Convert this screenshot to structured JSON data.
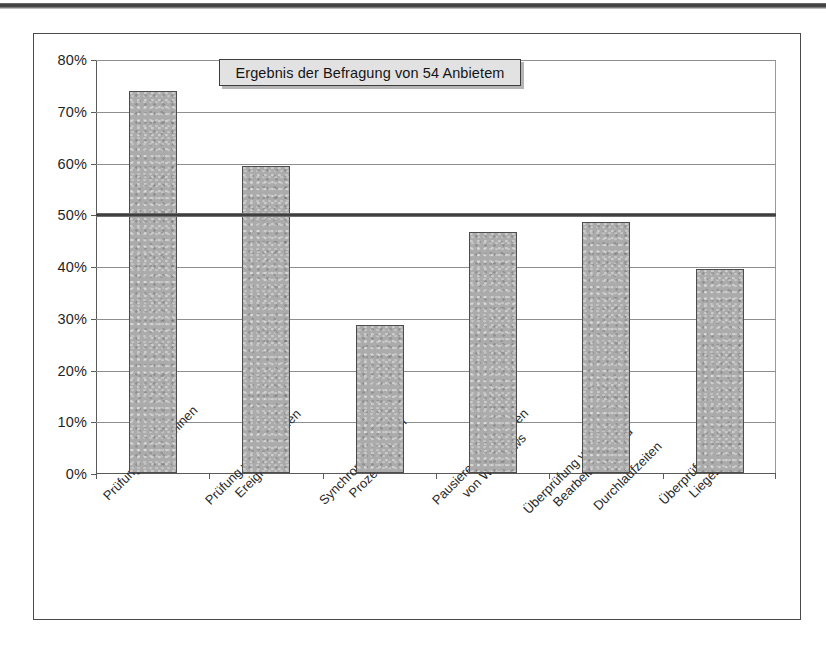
{
  "chart_data": {
    "type": "bar",
    "title": "Ergebnis der Befragung von 54 Anbietem",
    "xlabel": "",
    "ylabel": "",
    "ylim": [
      0,
      80
    ],
    "ytick_labels": [
      "80%",
      "70%",
      "60%",
      "50%",
      "40%",
      "30%",
      "20%",
      "10%",
      "0%"
    ],
    "ytick_values": [
      80,
      70,
      60,
      50,
      40,
      30,
      20,
      10,
      0
    ],
    "grid": true,
    "legend": "none",
    "bar_color": "#ababab",
    "bar_edge_color": "#4d4d4d",
    "reference_line": {
      "value": 50,
      "label": "50%",
      "color": "#3b3b3b",
      "width_px": 4
    },
    "categories": [
      "Prüfung von Terminen",
      "Prüfung von kritischen Ereignissen",
      "Synchronisation von Prozessen",
      "Pausieren / Stornieren von Workflows",
      "Überprüfung von Bearbeitungs- und Durchlaufzeiten",
      "Überprüfung von Liegezeiten"
    ],
    "category_lines": [
      [
        "Prüfung von Terminen"
      ],
      [
        "Prüfung von kritischen",
        "Ereignissen"
      ],
      [
        "Synchronisation von",
        "Prozessen"
      ],
      [
        "Pausieren / Stornieren",
        "von Workflows"
      ],
      [
        "Überprüfung von",
        "Bearbeitungs- und",
        "Durchlaufzeiten"
      ],
      [
        "Überprüfung von",
        "Liegezeiten"
      ]
    ],
    "values": [
      73.8,
      59.4,
      28.6,
      46.6,
      48.5,
      39.4
    ],
    "value_labels": [
      "73.8%",
      "59.4%",
      "28.6%",
      "46.6%",
      "48.5%",
      "39.4%"
    ]
  },
  "axis": {
    "y": {
      "ticks": [
        {
          "label": "80%",
          "value": 80
        },
        {
          "label": "70%",
          "value": 70
        },
        {
          "label": "60%",
          "value": 60
        },
        {
          "label": "50%",
          "value": 50
        },
        {
          "label": "40%",
          "value": 40
        },
        {
          "label": "30%",
          "value": 30
        },
        {
          "label": "20%",
          "value": 20
        },
        {
          "label": "10%",
          "value": 10
        },
        {
          "label": "0%",
          "value": 0
        }
      ]
    }
  },
  "colors": {
    "bar_fill": "#ababab",
    "bar_stroke": "#4d4d4d",
    "gridline": "#8e8e8e",
    "axis": "#5a5a5a",
    "reference_line": "#3b3b3b",
    "title_box_fill": "#e2e2e2",
    "frame": "#4a4a4a",
    "text": "#1f1f1f"
  }
}
